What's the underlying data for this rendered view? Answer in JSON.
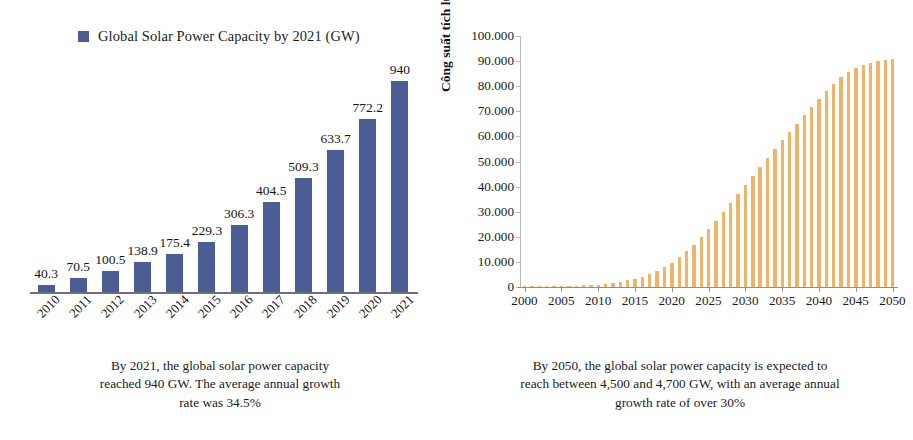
{
  "page": {
    "background": "#ffffff",
    "width": 913,
    "height": 440
  },
  "left_chart": {
    "legend": {
      "label": "Global Solar Power Capacity by 2021 (GW)",
      "swatch_color": "#4a5e94",
      "icon": "legend-square-icon"
    },
    "caption": "By 2021, the global solar power capacity reached 940 GW. The average annual growth rate was 34.5%"
  },
  "right_chart": {
    "y_axis_title": "Công suất tích lũy (GW)",
    "caption": "By 2050, the global solar power capacity is expected to reach between 4,500 and 4,700 GW, with an average annual growth rate of over 30%"
  },
  "chart_data": [
    {
      "type": "bar",
      "title": "",
      "series_name": "Global Solar Power Capacity by 2021 (GW)",
      "categories": [
        "2010",
        "2011",
        "2012",
        "2013",
        "2014",
        "2015",
        "2016",
        "2017",
        "2018",
        "2019",
        "2020",
        "2021"
      ],
      "values": [
        40.3,
        70.5,
        100.5,
        138.9,
        175.4,
        229.3,
        306.3,
        404.5,
        509.3,
        633.7,
        772.2,
        940
      ],
      "value_labels": [
        "40.3",
        "70.5",
        "100.5",
        "138.9",
        "175.4",
        "229.3",
        "306.3",
        "404.5",
        "509.3",
        "633.7",
        "772.2",
        "940"
      ],
      "xlabel": "",
      "ylabel": "",
      "ylim": [
        0,
        1040
      ],
      "grid": false,
      "legend_position": "top-left",
      "bar_color": "#4a5e94"
    },
    {
      "type": "bar",
      "title": "",
      "series_name": "Công suất tích lũy (GW)",
      "xlabel": "",
      "ylabel": "Công suất tích lũy (GW)",
      "ylim": [
        0,
        100000
      ],
      "ytick_labels": [
        "100.000",
        "90.000",
        "80.000",
        "70.000",
        "60.000",
        "50.000",
        "40.000",
        "30.000",
        "20.000",
        "10.000",
        "0"
      ],
      "ytick_values": [
        100000,
        90000,
        80000,
        70000,
        60000,
        50000,
        40000,
        30000,
        20000,
        10000,
        0
      ],
      "xtick_labels": [
        "2000",
        "2005",
        "2010",
        "2015",
        "2020",
        "2025",
        "2030",
        "2035",
        "2040",
        "2045",
        "2050"
      ],
      "xtick_values": [
        2000,
        2005,
        2010,
        2015,
        2020,
        2025,
        2030,
        2035,
        2040,
        2045,
        2050
      ],
      "xlim": [
        2000,
        2050
      ],
      "grid": false,
      "legend_position": "none",
      "bar_color": "#eeb469",
      "x": [
        2000,
        2001,
        2002,
        2003,
        2004,
        2005,
        2006,
        2007,
        2008,
        2009,
        2010,
        2011,
        2012,
        2013,
        2014,
        2015,
        2016,
        2017,
        2018,
        2019,
        2020,
        2021,
        2022,
        2023,
        2024,
        2025,
        2026,
        2027,
        2028,
        2029,
        2030,
        2031,
        2032,
        2033,
        2034,
        2035,
        2036,
        2037,
        2038,
        2039,
        2040,
        2041,
        2042,
        2043,
        2044,
        2045,
        2046,
        2047,
        2048,
        2049,
        2050
      ],
      "values": [
        40,
        60,
        90,
        130,
        190,
        260,
        350,
        470,
        620,
        790,
        1000,
        1300,
        1650,
        2100,
        2650,
        3300,
        4100,
        5100,
        6400,
        7900,
        9700,
        11800,
        14200,
        16900,
        19800,
        23000,
        26400,
        29900,
        33500,
        37100,
        40800,
        44400,
        48000,
        51500,
        55000,
        58400,
        61800,
        65100,
        68400,
        71600,
        74800,
        77900,
        81000,
        83500,
        85500,
        87200,
        88500,
        89400,
        90100,
        90600,
        91000
      ]
    }
  ]
}
